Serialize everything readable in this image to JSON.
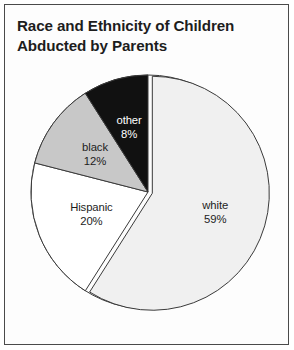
{
  "figure": {
    "title": "Race and Ethnicity of Children\nAbducted by Parents",
    "background_color": "#fdfdfd",
    "frame_color": "#4a4a4a",
    "title_color": "#1d1d1d"
  },
  "chart_data": {
    "type": "pie",
    "title": "Race and Ethnicity of Children Abducted by Parents",
    "xlabel": "",
    "ylabel": "",
    "units": "percent",
    "total": 99,
    "legend": "none (labels drawn inside slices)",
    "grid": false,
    "start_angle_deg": 0,
    "direction": "clockwise",
    "exploded_slice": "white",
    "categories": [
      "white",
      "Hispanic",
      "black",
      "other"
    ],
    "values": [
      59,
      20,
      12,
      8
    ],
    "labels": [
      "white",
      "Hispanic",
      "black",
      "other"
    ],
    "value_labels": [
      "59%",
      "20%",
      "12%",
      "8%"
    ],
    "slices": [
      {
        "name": "white",
        "value": 59,
        "value_label": "59%",
        "fill": "#f0f0f0",
        "stroke": "#3a3a3a",
        "text_color": "#1d1d1d",
        "exploded": true,
        "start_deg": 0,
        "end_deg": 212.4
      },
      {
        "name": "Hispanic",
        "value": 20,
        "value_label": "20%",
        "fill": "#ffffff",
        "stroke": "#3a3a3a",
        "text_color": "#1d1d1d",
        "exploded": false,
        "start_deg": 212.4,
        "end_deg": 284.4
      },
      {
        "name": "black",
        "value": 12,
        "value_label": "12%",
        "fill": "#c8c8c8",
        "stroke": "#3a3a3a",
        "text_color": "#1d1d1d",
        "exploded": false,
        "start_deg": 284.4,
        "end_deg": 327.6
      },
      {
        "name": "other",
        "value": 8,
        "value_label": "8%",
        "fill": "#111111",
        "stroke": "#3a3a3a",
        "text_color": "#ffffff",
        "exploded": false,
        "start_deg": 327.6,
        "end_deg": 360
      }
    ]
  }
}
